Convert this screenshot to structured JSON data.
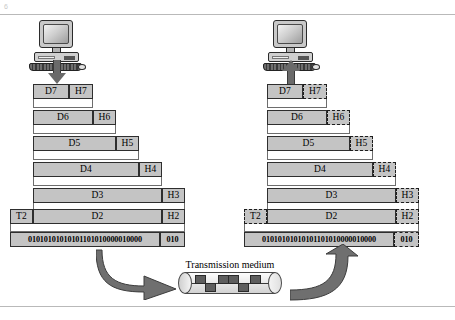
{
  "figure": {
    "corner_mark": "6",
    "medium_label": "Transmission medium"
  },
  "sender": {
    "icon": "desktop-computer-icon",
    "arrow": "arrow-down-icon",
    "direction": "encapsulation"
  },
  "receiver": {
    "icon": "desktop-computer-icon",
    "arrow": "arrow-up-icon",
    "direction": "decapsulation"
  },
  "layers": [
    {
      "level": 7,
      "data": "D7",
      "header": "H7",
      "trailer": null
    },
    {
      "level": 6,
      "data": "D6",
      "header": "H6",
      "trailer": null
    },
    {
      "level": 5,
      "data": "D5",
      "header": "H5",
      "trailer": null
    },
    {
      "level": 4,
      "data": "D4",
      "header": "H4",
      "trailer": null
    },
    {
      "level": 3,
      "data": "D3",
      "header": "H3",
      "trailer": null
    },
    {
      "level": 2,
      "data": "D2",
      "header": "H2",
      "trailer": "T2"
    }
  ],
  "physical": {
    "bits": "01010101010101101010000010000",
    "bits_tail": "010"
  },
  "flow": {
    "to_medium": "curved-arrow-right-icon",
    "from_medium": "curved-arrow-up-icon"
  },
  "colors": {
    "segment_fill": "#c4c4c4",
    "segment_border": "#2e2e2e",
    "arrow_gray": "#6a6a6a",
    "rule": "#b9b9b9"
  }
}
